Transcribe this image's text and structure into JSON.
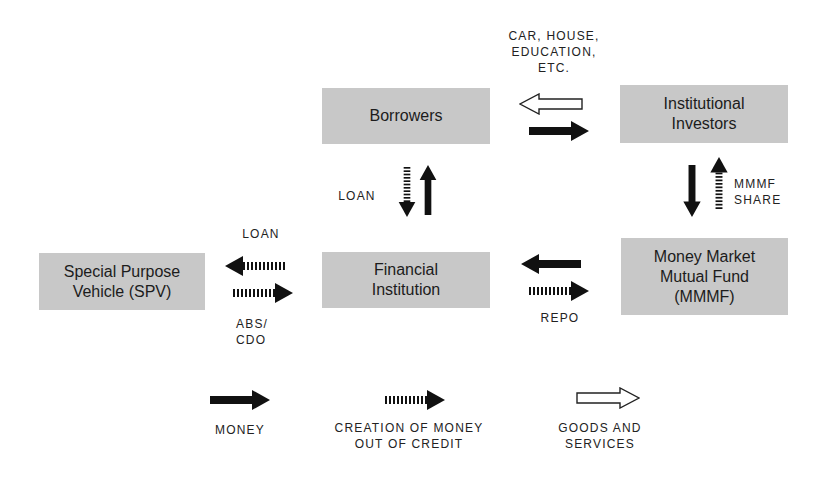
{
  "nodes": {
    "borrowers": "Borrowers",
    "institutional_investors": "Institutional\nInvestors",
    "financial_institution": "Financial\nInstitution",
    "mmmf": "Money Market\nMutual Fund\n(MMMF)",
    "spv": "Special Purpose\nVehicle (SPV)"
  },
  "labels": {
    "goods_top": "CAR, HOUSE,\nEDUCATION,\nETC.",
    "loan_vertical": "LOAN",
    "mmmf_share": "MMMF\nSHARE",
    "loan_spv": "LOAN",
    "abs_cdo": "ABS/\nCDO",
    "repo": "REPO"
  },
  "legend": {
    "money": "MONEY",
    "credit": "CREATION OF MONEY\nOUT OF CREDIT",
    "goods": "GOODS AND\nSERVICES"
  },
  "colors": {
    "box_fill": "#c8c8c8",
    "arrow_fill": "#111111",
    "hollow_fill": "#ffffff"
  }
}
